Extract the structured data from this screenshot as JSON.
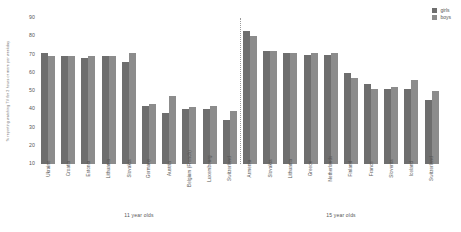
{
  "chart_data": {
    "type": "bar",
    "title": "",
    "xlabel": "",
    "ylabel": "% reporting watching TV for 2 hours or more per weekday",
    "ylim": [
      10,
      90
    ],
    "yticks": [
      10,
      20,
      30,
      40,
      50,
      60,
      70,
      80,
      90
    ],
    "grid": false,
    "legend_position": "top-right",
    "legend": [
      "girls",
      "boys"
    ],
    "groups": [
      {
        "name": "11 year olds",
        "categories": [
          "Ukraine",
          "Croatia",
          "Estonia",
          "Lithuania",
          "Slovakia",
          "Germany",
          "Austria",
          "Belgium (French)",
          "Luxembourg",
          "Switzerland"
        ],
        "series": [
          {
            "name": "girls",
            "values": [
              71,
              69,
              68,
              69,
              66,
              42,
              38,
              40,
              40,
              34
            ]
          },
          {
            "name": "boys",
            "values": [
              69,
              69,
              69,
              69,
              71,
              43,
              47,
              41,
              42,
              39
            ]
          }
        ]
      },
      {
        "name": "15 year olds",
        "categories": [
          "Armenia",
          "Slovakia",
          "Lithuania",
          "Greece",
          "Netherlands",
          "Finland",
          "France",
          "Slovenia",
          "Iceland",
          "Switzerland"
        ],
        "series": [
          {
            "name": "girls",
            "values": [
              83,
              72,
              71,
              70,
              70,
              60,
              54,
              51,
              51,
              45
            ]
          },
          {
            "name": "boys",
            "values": [
              80,
              72,
              71,
              71,
              71,
              57,
              51,
              52,
              56,
              50
            ]
          }
        ]
      }
    ],
    "colors": {
      "girls": "#6e6e6e",
      "boys": "#8c8c8c",
      "divider": "#9a9a9a"
    }
  }
}
